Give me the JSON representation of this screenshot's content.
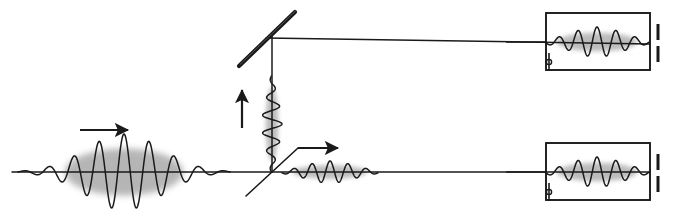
{
  "figure": {
    "background_color": "#ffffff",
    "stroke_color": "#1a1a1a",
    "envelope_color": "#7a7a7a",
    "width": 681,
    "height": 224
  },
  "optics": {
    "input_beam": {
      "label": "input-beam-line",
      "x1": 12,
      "y1": 172,
      "x2": 272,
      "y2": 172
    },
    "transmitted_beam": {
      "label": "transmitted-beam-line",
      "x1": 272,
      "y1": 172,
      "x2": 650,
      "y2": 172
    },
    "vertical_beam": {
      "label": "reflected-vertical-beam-line",
      "x1": 272,
      "y1": 172,
      "x2": 272,
      "y2": 36
    },
    "top_beam": {
      "label": "top-horizontal-beam-line",
      "x1": 266,
      "y1": 38,
      "x2": 650,
      "y2": 44
    },
    "beam_splitter": {
      "label": "beam-splitter",
      "x1": 246,
      "y1": 196,
      "x2": 298,
      "y2": 148,
      "thickness": 1.6
    },
    "mirror": {
      "label": "mirror",
      "x1": 239,
      "y1": 66,
      "x2": 295,
      "y2": 12,
      "thickness": 4.2
    }
  },
  "arrows": {
    "input_direction": {
      "name": "arrow-input-right",
      "x1": 80,
      "y1": 130,
      "x2": 128,
      "y2": 130,
      "dir": "right"
    },
    "transmitted_direction": {
      "name": "arrow-transmitted-right",
      "x1": 298,
      "y1": 148,
      "x2": 338,
      "y2": 148,
      "dir": "right"
    },
    "reflected_direction": {
      "name": "arrow-reflected-up",
      "x1": 242,
      "y1": 128,
      "x2": 242,
      "y2": 90,
      "dir": "up"
    }
  },
  "wave_packets": [
    {
      "name": "input-wave-packet",
      "orientation": "horizontal",
      "center_x": 124,
      "center_y": 172,
      "amplitude": 38,
      "sigma": 38,
      "wavelength": 25,
      "span": 106,
      "envelope_opacity": 0.55
    },
    {
      "name": "transmitted-wave-packet",
      "orientation": "horizontal",
      "center_x": 330,
      "center_y": 172,
      "amplitude": 11,
      "sigma": 24,
      "wavelength": 18,
      "span": 48,
      "envelope_opacity": 0.5
    },
    {
      "name": "reflected-wave-packet",
      "orientation": "vertical",
      "center_x": 272,
      "center_y": 124,
      "amplitude": 10,
      "sigma": 24,
      "wavelength": 18,
      "span": 48,
      "envelope_opacity": 0.5
    },
    {
      "name": "detector-top-wave-packet",
      "orientation": "horizontal",
      "center_x": 597,
      "center_y": 42,
      "amplitude": 15,
      "sigma": 26,
      "wavelength": 19,
      "span": 52,
      "envelope_opacity": 0.5
    },
    {
      "name": "detector-bottom-wave-packet",
      "orientation": "horizontal",
      "center_x": 597,
      "center_y": 172,
      "amplitude": 15,
      "sigma": 26,
      "wavelength": 19,
      "span": 52,
      "envelope_opacity": 0.5
    }
  ],
  "detectors": [
    {
      "name": "detector-top",
      "box": {
        "x": 546,
        "y": 13,
        "width": 104,
        "height": 57
      },
      "terminal_marks": {
        "upper": {
          "x": 658,
          "y1": 24,
          "y2": 40
        },
        "lower": {
          "x": 658,
          "y1": 46,
          "y2": 62
        }
      },
      "corner_loop": {
        "cx": 549,
        "cy": 62,
        "r": 2.6
      },
      "lead_in": {
        "x1": 506,
        "y1": 42,
        "x2": 546,
        "y2": 42
      }
    },
    {
      "name": "detector-bottom",
      "box": {
        "x": 546,
        "y": 143,
        "width": 104,
        "height": 57
      },
      "terminal_marks": {
        "upper": {
          "x": 658,
          "y1": 154,
          "y2": 170
        },
        "lower": {
          "x": 658,
          "y1": 176,
          "y2": 192
        }
      },
      "corner_loop": {
        "cx": 549,
        "cy": 192,
        "r": 2.6
      },
      "lead_in": {
        "x1": 506,
        "y1": 172,
        "x2": 546,
        "y2": 172
      }
    }
  ]
}
